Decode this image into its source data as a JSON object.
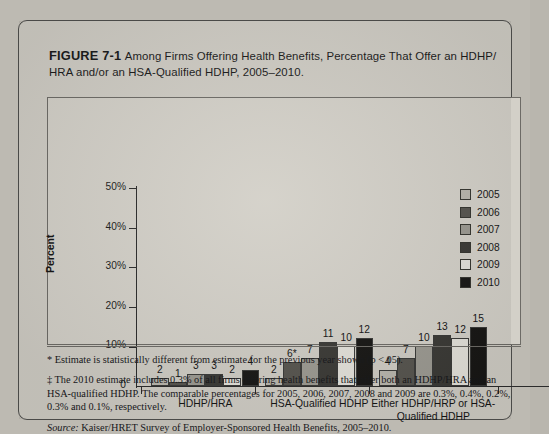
{
  "figure": {
    "number": "FIGURE 7-1",
    "title": "Among Firms Offering Health Benefits, Percentage That Offer an HDHP/ HRA and/or an HSA-Qualified HDHP, 2005–2010."
  },
  "notes": {
    "note1": "* Estimate is statistically different from estimate for the previous year shown (p <.05).",
    "note2": "‡ The 2010 estimate includes 0.3% of all firms offering health benefits that offer both an HDHP/HRA and an HSA-qualified HDHP. The comparable percentages for 2005, 2006, 2007, 2008 and 2009 are 0.3%, 0.4%, 0.2%, 0.3% and 0.1%, respectively.",
    "source_word": "Source:",
    "source_text": " Kaiser/HRET Survey of Employer-Sponsored Health Benefits, 2005–2010."
  },
  "chart_data": {
    "type": "bar",
    "xlabel": "",
    "ylabel": "Percent",
    "ylim": [
      0,
      50
    ],
    "yticks": [
      0,
      10,
      20,
      30,
      40,
      50
    ],
    "ytick_labels": [
      "0",
      "10%",
      "20%",
      "30%",
      "40%",
      "50%"
    ],
    "grid": false,
    "legend_position": "right",
    "categories": [
      "HDHP/HRA",
      "HSA-Qualified HDHP",
      "Either HDHP/HRP or HSA-Qualified HDHP"
    ],
    "series": [
      {
        "name": "2005",
        "color": "#b9b6ad",
        "values": [
          2,
          2,
          4
        ],
        "labels": [
          "2",
          "2",
          "4"
        ]
      },
      {
        "name": "2006",
        "color": "#57554f",
        "values": [
          1,
          6,
          7
        ],
        "labels": [
          "1",
          "6*",
          "7"
        ]
      },
      {
        "name": "2007",
        "color": "#9c9a92",
        "values": [
          3,
          7,
          10
        ],
        "labels": [
          "3",
          "7",
          "10"
        ]
      },
      {
        "name": "2008",
        "color": "#3b3a36",
        "values": [
          3,
          11,
          13
        ],
        "labels": [
          "3",
          "11",
          "13"
        ]
      },
      {
        "name": "2009",
        "color": "#e3e1da",
        "values": [
          2,
          10,
          12
        ],
        "labels": [
          "2",
          "10",
          "12"
        ]
      },
      {
        "name": "2010",
        "color": "#181715",
        "values": [
          4,
          12,
          15
        ],
        "labels": [
          "4",
          "12",
          "15"
        ]
      }
    ]
  },
  "legend": {
    "items": [
      {
        "label": "2005",
        "color": "#b9b6ad"
      },
      {
        "label": "2006",
        "color": "#57554f"
      },
      {
        "label": "2007",
        "color": "#9c9a92"
      },
      {
        "label": "2008",
        "color": "#3b3a36"
      },
      {
        "label": "2009",
        "color": "#e3e1da"
      },
      {
        "label": "2010",
        "color": "#181715"
      }
    ]
  }
}
